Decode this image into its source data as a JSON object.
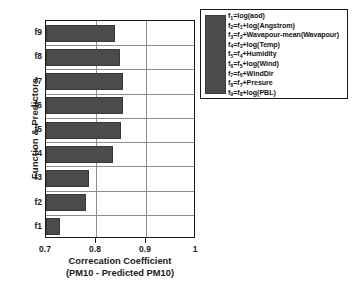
{
  "chart_data": {
    "type": "bar",
    "orientation": "horizontal",
    "title": "",
    "xlabel": "Correcation Coefficient (PM10 - Predicted PM10)",
    "xlabel_lines": [
      "Correcation Coefficient",
      "(PM10 - Predicted PM10)"
    ],
    "ylabel": "Function & Predictors",
    "categories": [
      "f1",
      "f2",
      "f3",
      "f4",
      "f5",
      "f6",
      "f7",
      "f8",
      "f9"
    ],
    "values": [
      0.727,
      0.779,
      0.786,
      0.833,
      0.85,
      0.853,
      0.853,
      0.847,
      0.838
    ],
    "xlim": [
      0.7,
      1.0
    ],
    "xticks": [
      0.7,
      0.8,
      0.9,
      1.0
    ],
    "xtick_labels": [
      "0.7",
      "0.8",
      "0.9",
      "1"
    ],
    "grid": true,
    "legend_position": "right-outside",
    "bar_color": "#4b4b4b",
    "axis_color": "#1a1a1a",
    "grid_color": "#8d8d8d"
  },
  "legend": {
    "swatch_color": "#4b4b4b",
    "entries": [
      {
        "lhs": "f",
        "lhs_sub": "1",
        "rhs": "=log(aod)"
      },
      {
        "lhs": "f",
        "lhs_sub": "2",
        "rhs": "=f",
        "rhs_sub": "1",
        "tail": "+log(Angstrom)"
      },
      {
        "lhs": "f",
        "lhs_sub": "3",
        "rhs": "=f",
        "rhs_sub": "2",
        "tail": "+Wavapour-mean(Wavapour)"
      },
      {
        "lhs": "f",
        "lhs_sub": "4",
        "rhs": "=f",
        "rhs_sub": "3",
        "tail": "+log(Temp)"
      },
      {
        "lhs": "f",
        "lhs_sub": "5",
        "rhs": "=f",
        "rhs_sub": "4",
        "tail": "+Humidity"
      },
      {
        "lhs": "f",
        "lhs_sub": "6",
        "rhs": "=f",
        "rhs_sub": "5",
        "tail": "+log(Wind)"
      },
      {
        "lhs": "f",
        "lhs_sub": "7",
        "rhs": "=f",
        "rhs_sub": "6",
        "tail": "+WindDir"
      },
      {
        "lhs": "f",
        "lhs_sub": "8",
        "rhs": "=f",
        "rhs_sub": "7",
        "tail": "+Presure"
      },
      {
        "lhs": "f",
        "lhs_sub": "9",
        "rhs": "=f",
        "rhs_sub": "8",
        "tail": "+log(PBL)"
      }
    ],
    "entries_text": [
      "f1=log(aod)",
      "f2=f1+log(Angstrom)",
      "f3=f2+Wavapour-mean(Wavapour)",
      "f4=f3+log(Temp)",
      "f5=f4+Humidity",
      "f6=f5+log(Wind)",
      "f7=f6+WindDir",
      "f8=f7+Presure",
      "f9=f8+log(PBL)"
    ]
  }
}
